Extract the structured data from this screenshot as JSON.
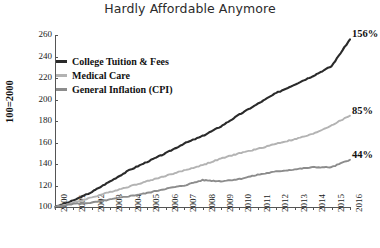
{
  "chart_data": {
    "type": "line",
    "title": "Hardly Affordable Anymore",
    "xlabel": "",
    "ylabel": "100=2000",
    "ylim": [
      100,
      260
    ],
    "yticks": [
      100,
      120,
      140,
      160,
      180,
      200,
      220,
      240,
      260
    ],
    "grid": false,
    "legend_position": "upper left",
    "x": [
      2000,
      2001,
      2002,
      2003,
      2004,
      2005,
      2006,
      2007,
      2008,
      2009,
      2010,
      2011,
      2012,
      2013,
      2014,
      2015,
      2016
    ],
    "xticklabels": [
      "2000",
      "2001",
      "2002",
      "2003",
      "2004",
      "2005",
      "2006",
      "2007",
      "2008",
      "2009",
      "2010",
      "2011",
      "2012",
      "2013",
      "2014",
      "2015",
      "2016"
    ],
    "series": [
      {
        "name": "College Tuition & Fees",
        "color": "#2a2a2a",
        "end_label": "156%",
        "values": [
          100,
          106,
          114,
          124,
          134,
          142,
          150,
          159,
          166,
          175,
          186,
          196,
          206,
          214,
          222,
          231,
          256
        ]
      },
      {
        "name": "Medical Care",
        "color": "#b3b3b3",
        "end_label": "85%",
        "values": [
          100,
          104,
          109,
          114,
          119,
          124,
          129,
          134,
          139,
          145,
          150,
          154,
          159,
          163,
          168,
          176,
          185
        ]
      },
      {
        "name": "General Inflation (CPI)",
        "color": "#8c8c8c",
        "end_label": "44%",
        "values": [
          100,
          103,
          104,
          107,
          110,
          113,
          117,
          120,
          125,
          124,
          126,
          130,
          133,
          135,
          137,
          137,
          144
        ]
      }
    ]
  },
  "colors": {
    "axis": "#555555",
    "text": "#1a1a1a",
    "title": "#2b2b2b",
    "background": "#ffffff"
  }
}
